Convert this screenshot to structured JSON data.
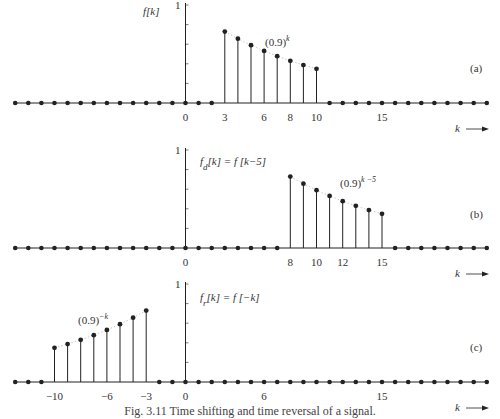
{
  "figure": {
    "caption": "Fig. 3.11  Time shifting and time reversal of a signal."
  },
  "colors": {
    "stem": "#222222",
    "axis": "#222222",
    "envelope": "#bbbbbb"
  },
  "chart_data": [
    {
      "type": "stem",
      "panel": "(a)",
      "title": "f[k]",
      "formula_label": "(0.9)^k",
      "xlabel": "k",
      "ylabel": "f[k]",
      "y_tick_label": "1",
      "ylim": [
        0,
        1
      ],
      "xlim": [
        -13,
        23
      ],
      "x_tick_labels": [
        "0",
        "3",
        "6",
        "8",
        "10",
        "15"
      ],
      "x_ticks": [
        0,
        3,
        6,
        8,
        10,
        15
      ],
      "x": [
        3,
        4,
        5,
        6,
        7,
        8,
        9,
        10
      ],
      "values": [
        0.729,
        0.656,
        0.59,
        0.531,
        0.478,
        0.43,
        0.387,
        0.349
      ],
      "zero_elsewhere": true
    },
    {
      "type": "stem",
      "panel": "(b)",
      "title": "f_d[k] = f[k-5]",
      "formula_label": "(0.9)^(k-5)",
      "xlabel": "k",
      "y_tick_label": "1",
      "ylim": [
        0,
        1
      ],
      "xlim": [
        -13,
        23
      ],
      "x_tick_labels": [
        "0",
        "8",
        "10",
        "12",
        "15"
      ],
      "x_ticks": [
        0,
        8,
        10,
        12,
        15
      ],
      "x": [
        8,
        9,
        10,
        11,
        12,
        13,
        14,
        15
      ],
      "values": [
        0.729,
        0.656,
        0.59,
        0.531,
        0.478,
        0.43,
        0.387,
        0.349
      ],
      "zero_elsewhere": true
    },
    {
      "type": "stem",
      "panel": "(c)",
      "title": "f_r[k] = f[-k]",
      "formula_label": "(0.9)^(-k)",
      "xlabel": "k",
      "y_tick_label": "1",
      "ylim": [
        0,
        1
      ],
      "xlim": [
        -13,
        23
      ],
      "x_tick_labels": [
        "-10",
        "-6",
        "-3",
        "0",
        "6",
        "15"
      ],
      "x_ticks": [
        -10,
        -6,
        -3,
        0,
        6,
        15
      ],
      "x": [
        -10,
        -9,
        -8,
        -7,
        -6,
        -5,
        -4,
        -3
      ],
      "values": [
        0.349,
        0.387,
        0.43,
        0.478,
        0.531,
        0.59,
        0.656,
        0.729
      ],
      "zero_elsewhere": true
    }
  ]
}
